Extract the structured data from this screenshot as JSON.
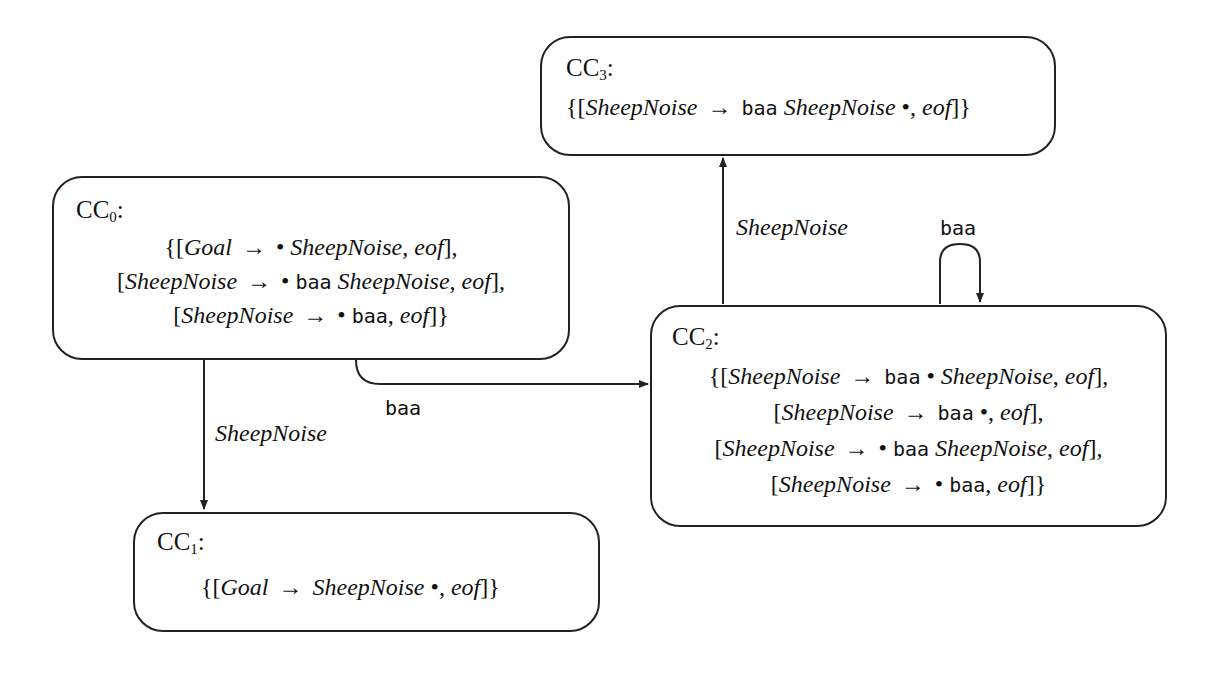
{
  "diagram": {
    "nodes": [
      {
        "id": "CC0",
        "label_base": "CC",
        "label_sub": "0",
        "label_suffix": ":",
        "items": [
          {
            "open": "{[",
            "lhs": "Goal",
            "arrow": "→",
            "dot_before": "•",
            "rhs_term": "",
            "rhs_nt": "SheepNoise",
            "lookahead": "eof",
            "close": "],"
          },
          {
            "open": "[",
            "lhs": "SheepNoise",
            "arrow": "→",
            "dot_before": "•",
            "rhs_term": "baa",
            "rhs_nt": "SheepNoise",
            "lookahead": "eof",
            "close": "],"
          },
          {
            "open": "[",
            "lhs": "SheepNoise",
            "arrow": "→",
            "dot_before": "•",
            "rhs_term": "baa",
            "rhs_nt": "",
            "lookahead": "eof",
            "close": "]}"
          }
        ]
      },
      {
        "id": "CC1",
        "label_base": "CC",
        "label_sub": "1",
        "label_suffix": ":",
        "items": [
          {
            "open": "{[",
            "lhs": "Goal",
            "arrow": "→",
            "rhs_nt": "SheepNoise",
            "dot_after": "•",
            "lookahead": "eof",
            "close": "]}"
          }
        ]
      },
      {
        "id": "CC2",
        "label_base": "CC",
        "label_sub": "2",
        "label_suffix": ":",
        "items": [
          {
            "open": "{[",
            "lhs": "SheepNoise",
            "arrow": "→",
            "rhs_term": "baa",
            "dot_mid": "•",
            "rhs_nt": "SheepNoise",
            "lookahead": "eof",
            "close": "],"
          },
          {
            "open": "[",
            "lhs": "SheepNoise",
            "arrow": "→",
            "rhs_term": "baa",
            "dot_after": "•",
            "lookahead": "eof",
            "close": "],"
          },
          {
            "open": "[",
            "lhs": "SheepNoise",
            "arrow": "→",
            "dot_before": "•",
            "rhs_term": "baa",
            "rhs_nt": "SheepNoise",
            "lookahead": "eof",
            "close": "],"
          },
          {
            "open": "[",
            "lhs": "SheepNoise",
            "arrow": "→",
            "dot_before": "•",
            "rhs_term": "baa",
            "lookahead": "eof",
            "close": "]}"
          }
        ]
      },
      {
        "id": "CC3",
        "label_base": "CC",
        "label_sub": "3",
        "label_suffix": ":",
        "items": [
          {
            "open": "{[",
            "lhs": "SheepNoise",
            "arrow": "→",
            "rhs_term": "baa",
            "rhs_nt": "SheepNoise",
            "dot_after": "•",
            "lookahead": "eof",
            "close": "]}"
          }
        ]
      }
    ],
    "edges": [
      {
        "from": "CC0",
        "to": "CC1",
        "label": "SheepNoise"
      },
      {
        "from": "CC0",
        "to": "CC2",
        "label": "baa"
      },
      {
        "from": "CC2",
        "to": "CC3",
        "label": "SheepNoise"
      },
      {
        "from": "CC2",
        "to": "CC2",
        "label": "baa"
      }
    ],
    "colors": {
      "stroke": "#222222",
      "background": "#ffffff",
      "text": "#111111"
    }
  }
}
